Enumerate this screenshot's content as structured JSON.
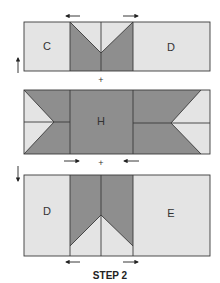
{
  "diagram": {
    "caption": "STEP 2",
    "colors": {
      "light": "#e4e4e4",
      "dark": "#8e8e8e",
      "line": "#3a3a3a"
    },
    "rows": [
      {
        "name": "top-unit",
        "labels": [
          "C",
          "D"
        ],
        "left_arrow": "up-arrow",
        "top_arrows": [
          "left-arrow",
          "right-arrow"
        ]
      },
      {
        "name": "middle-unit",
        "labels": [
          "H"
        ],
        "bottom_arrows": [
          "right-arrow",
          "left-arrow"
        ]
      },
      {
        "name": "bottom-unit",
        "labels": [
          "D",
          "E"
        ],
        "left_arrow": "down-arrow",
        "bottom_arrows": [
          "left-arrow",
          "right-arrow"
        ]
      }
    ],
    "joiners": [
      "+",
      "+"
    ]
  }
}
